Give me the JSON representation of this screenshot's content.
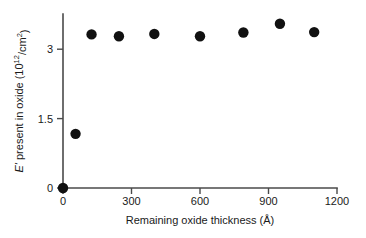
{
  "chart_data": {
    "type": "scatter",
    "title": "",
    "xlabel": "Remaining oxide thickness (Å)",
    "ylabel": "E' present in oxide (10^12/cm^2)",
    "ylabel_parts": {
      "symbol": "E'",
      "text": " present in oxide (10",
      "exponent": "12",
      "tail": "/cm",
      "exponent2": "2",
      "close": ")"
    },
    "xlim": [
      0,
      1200
    ],
    "ylim": [
      0,
      3.8
    ],
    "xticks": [
      0,
      300,
      600,
      900,
      1200
    ],
    "xtick_labels": [
      "0",
      "300",
      "600",
      "900",
      "1200"
    ],
    "yticks": [
      0,
      1.5,
      3
    ],
    "ytick_labels": [
      "0",
      "1.5",
      "3"
    ],
    "grid": false,
    "legend": "none",
    "marker": "filled-circle",
    "marker_color": "#111111",
    "axis_color": "#4a4a4a",
    "series": [
      {
        "name": "E' centers",
        "points": [
          {
            "x": 0,
            "y": 0
          },
          {
            "x": 55,
            "y": 1.17
          },
          {
            "x": 125,
            "y": 3.32
          },
          {
            "x": 245,
            "y": 3.28
          },
          {
            "x": 400,
            "y": 3.33
          },
          {
            "x": 600,
            "y": 3.28
          },
          {
            "x": 790,
            "y": 3.36
          },
          {
            "x": 950,
            "y": 3.55
          },
          {
            "x": 1100,
            "y": 3.37
          }
        ]
      }
    ]
  }
}
